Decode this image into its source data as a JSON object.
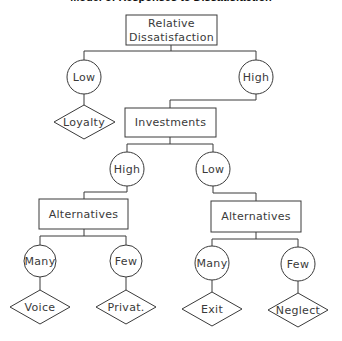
{
  "title": "Model of Responses to Dissatisfaction",
  "colors": {
    "line": "#3a3a3a",
    "background": "#ffffff"
  },
  "nodes": {
    "root": {
      "type": "box",
      "lines": [
        "Relative",
        "Dissatisfaction"
      ]
    },
    "dissat_low": {
      "type": "circle",
      "label": "Low"
    },
    "dissat_high": {
      "type": "circle",
      "label": "High"
    },
    "loyalty": {
      "type": "diamond",
      "label": "Loyalty"
    },
    "investments": {
      "type": "box",
      "label": "Investments"
    },
    "inv_high": {
      "type": "circle",
      "label": "High"
    },
    "inv_low": {
      "type": "circle",
      "label": "Low"
    },
    "alt_left": {
      "type": "box",
      "label": "Alternatives"
    },
    "alt_right": {
      "type": "box",
      "label": "Alternatives"
    },
    "left_many": {
      "type": "circle",
      "label": "Many"
    },
    "left_few": {
      "type": "circle",
      "label": "Few"
    },
    "right_many": {
      "type": "circle",
      "label": "Many"
    },
    "right_few": {
      "type": "circle",
      "label": "Few"
    },
    "voice": {
      "type": "diamond",
      "label": "Voice"
    },
    "privat": {
      "type": "diamond",
      "label": "Privat."
    },
    "exit": {
      "type": "diamond",
      "label": "Exit"
    },
    "neglect": {
      "type": "diamond",
      "label": "Neglect"
    }
  },
  "edges": [
    [
      "root",
      "dissat_low"
    ],
    [
      "root",
      "dissat_high"
    ],
    [
      "dissat_low",
      "loyalty"
    ],
    [
      "dissat_high",
      "investments"
    ],
    [
      "investments",
      "inv_high"
    ],
    [
      "investments",
      "inv_low"
    ],
    [
      "inv_high",
      "alt_left"
    ],
    [
      "inv_low",
      "alt_right"
    ],
    [
      "alt_left",
      "left_many"
    ],
    [
      "alt_left",
      "left_few"
    ],
    [
      "alt_right",
      "right_many"
    ],
    [
      "alt_right",
      "right_few"
    ],
    [
      "left_many",
      "voice"
    ],
    [
      "left_few",
      "privat"
    ],
    [
      "right_many",
      "exit"
    ],
    [
      "right_few",
      "neglect"
    ]
  ]
}
